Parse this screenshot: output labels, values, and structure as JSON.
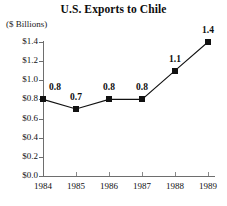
{
  "chart_data": {
    "type": "line",
    "title": "U.S. Exports to Chile",
    "ylabel": "($ Billions)",
    "xlabel": "",
    "categories": [
      "1984",
      "1985",
      "1986",
      "1987",
      "1988",
      "1989"
    ],
    "values": [
      0.8,
      0.7,
      0.8,
      0.8,
      1.1,
      1.4
    ],
    "point_labels": [
      "0.8",
      "0.7",
      "0.8",
      "0.8",
      "1.1",
      "1.4"
    ],
    "ylim": [
      0.0,
      1.4
    ],
    "ytick_labels": [
      "$0.0",
      "$0.2",
      "$0.4",
      "$0.6",
      "$0.8",
      "$1.0",
      "$1.2",
      "$1.4"
    ],
    "ytick_values": [
      0.0,
      0.2,
      0.4,
      0.6,
      0.8,
      1.0,
      1.2,
      1.4
    ],
    "grid": false,
    "legend": false,
    "marker": "filled-square",
    "series_color": "#111111",
    "axis_color": "#6e6e6e"
  }
}
